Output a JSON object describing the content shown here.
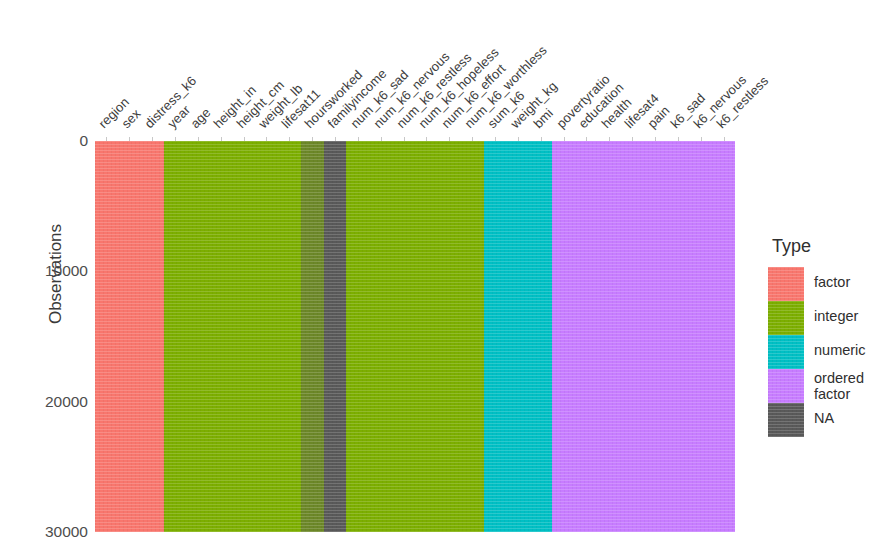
{
  "chart_data": {
    "type": "heatmap",
    "title": "",
    "xlabel": "",
    "ylabel": "Observations",
    "legend_title": "Type",
    "legend_position": "right",
    "grid": true,
    "ylim": [
      0,
      30000
    ],
    "y_ticks": [
      "0",
      "10000",
      "20000",
      "30000"
    ],
    "y_tick_values": [
      0,
      10000,
      20000,
      30000
    ],
    "y_direction": "reversed",
    "categories": [
      "region",
      "sex",
      "distress_k6",
      "year",
      "age",
      "height_in",
      "height_cm",
      "weight_lb",
      "lifesat11",
      "hoursworked",
      "familyincome",
      "num_k6_sad",
      "num_k6_nervous",
      "num_k6_restless",
      "num_k6_hopeless",
      "num_k6_effort",
      "num_k6_worthless",
      "sum_k6",
      "weight_kg",
      "bmi",
      "povertyratio",
      "education",
      "health",
      "lifesat4",
      "pain",
      "k6_sad",
      "k6_nervous",
      "k6_restless",
      "k6_hopeless",
      "k6_effort",
      "k6_worthless"
    ],
    "colors": {
      "factor": "#F8766D",
      "integer": "#7CAE00",
      "numeric": "#00BFC4",
      "ordered_factor": "#C77CFF",
      "na": "#595959"
    },
    "legend_entries": [
      {
        "label": "factor",
        "color": "#F8766D"
      },
      {
        "label": "integer",
        "color": "#7CAE00"
      },
      {
        "label": "numeric",
        "color": "#00BFC4"
      },
      {
        "label": "ordered\nfactor",
        "color": "#C77CFF"
      },
      {
        "label": "NA",
        "color": "#595959"
      }
    ],
    "bands": [
      {
        "name": "factor-block",
        "type": "factor",
        "start_col": 0,
        "end_col": 3,
        "color": "#F8766D",
        "na_fraction": 0.0
      },
      {
        "name": "integer-block-1",
        "type": "integer",
        "start_col": 3,
        "end_col": 9,
        "color": "#7CAE00",
        "na_fraction": 0.0
      },
      {
        "name": "integer-partial-na",
        "type": "integer",
        "start_col": 9,
        "end_col": 10,
        "color": "#7CAE00",
        "na_fraction": 0.45
      },
      {
        "name": "na-block",
        "type": "NA",
        "start_col": 10,
        "end_col": 11,
        "color": "#595959",
        "na_fraction": 1.0
      },
      {
        "name": "integer-block-2",
        "type": "integer",
        "start_col": 11,
        "end_col": 17,
        "color": "#7CAE00",
        "na_fraction": 0.0
      },
      {
        "name": "numeric-block",
        "type": "numeric",
        "start_col": 17,
        "end_col": 20,
        "color": "#00BFC4",
        "na_fraction": 0.0
      },
      {
        "name": "ordered-factor-block",
        "type": "ordered factor",
        "start_col": 20,
        "end_col": 28,
        "color": "#C77CFF",
        "na_fraction": 0.0
      }
    ],
    "n_columns": 28,
    "n_observations": 30000
  },
  "axes": {
    "y_axis_label": "Observations",
    "y_ticks": [
      "0",
      "10000",
      "20000",
      "30000"
    ]
  },
  "legend": {
    "title": "Type",
    "items": [
      {
        "label": "factor"
      },
      {
        "label": "integer"
      },
      {
        "label": "numeric"
      },
      {
        "label_line1": "ordered",
        "label_line2": "factor"
      },
      {
        "label": "NA"
      }
    ]
  }
}
